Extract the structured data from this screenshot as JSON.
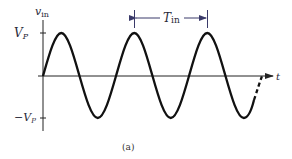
{
  "diagram": {
    "type": "sinusoid-waveform",
    "y_axis_label": "v",
    "y_axis_label_sub": "in",
    "x_axis_label": "t",
    "ticks": {
      "positive": {
        "label": "V",
        "sub": "P"
      },
      "negative": {
        "label": "−V",
        "sub": "P"
      }
    },
    "period_label": "T",
    "period_label_sub": "in",
    "caption": "(a)",
    "colors": {
      "waveform": "#111111",
      "axes": "#222222",
      "annotation": "#3a3a6a"
    }
  }
}
